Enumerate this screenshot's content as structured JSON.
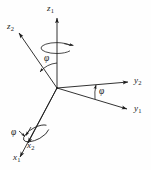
{
  "figure": {
    "kind": "coordinate-frame-rotation-diagram",
    "stroke_color": "#1c1c1c",
    "background_color": "#fefefe",
    "origin": {
      "x": 57,
      "y": 88
    },
    "axes": [
      {
        "name": "z1",
        "label": "z",
        "subscript": "1",
        "from": {
          "x": 57,
          "y": 88
        },
        "to": {
          "x": 57,
          "y": 16
        },
        "arrow": true
      },
      {
        "name": "z2",
        "label": "z",
        "subscript": "2",
        "from": {
          "x": 57,
          "y": 88
        },
        "to": {
          "x": 17,
          "y": 31
        },
        "arrow": true
      },
      {
        "name": "y2",
        "label": "y",
        "subscript": "2",
        "from": {
          "x": 57,
          "y": 88
        },
        "to": {
          "x": 131,
          "y": 82
        },
        "arrow": true
      },
      {
        "name": "y1",
        "label": "y",
        "subscript": "1",
        "from": {
          "x": 57,
          "y": 88
        },
        "to": {
          "x": 130,
          "y": 110
        },
        "arrow": true
      },
      {
        "name": "x2",
        "label": "x",
        "subscript": "2",
        "from": {
          "x": 57,
          "y": 88
        },
        "to": {
          "x": 26,
          "y": 146
        },
        "arrow": true
      },
      {
        "name": "x1",
        "label": "x",
        "subscript": "1",
        "from": {
          "x": 57,
          "y": 88
        },
        "to": {
          "x": 18,
          "y": 160
        },
        "arrow": true
      }
    ],
    "angles": [
      {
        "name": "phi-z",
        "symbol": "φ",
        "between": [
          "z2",
          "z1"
        ]
      },
      {
        "name": "phi-y",
        "symbol": "φ",
        "between": [
          "y1",
          "y2"
        ]
      },
      {
        "name": "phi-x",
        "symbol": "φ",
        "between": [
          "x1",
          "x2"
        ]
      }
    ],
    "rotation_indicators": [
      {
        "name": "rotation-ellipse-z1",
        "about_axis": "z1",
        "center": {
          "x": 57,
          "y": 48
        },
        "rx": 16,
        "ry": 5.5,
        "direction": "counterclockwise"
      },
      {
        "name": "rotation-ellipse-x2",
        "about_axis": "x2",
        "center": {
          "x": 37,
          "y": 133
        },
        "rx": 15,
        "ry": 6,
        "direction": "counterclockwise"
      }
    ]
  }
}
